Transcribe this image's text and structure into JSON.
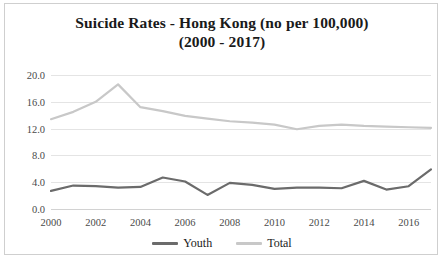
{
  "chart_data": {
    "type": "line",
    "title": "Suicide Rates - Hong Kong (no per 100,000) (2000 - 2017)",
    "title_line1": "Suicide Rates - Hong Kong (no per 100,000)",
    "title_line2": "(2000 - 2017)",
    "xlabel": "",
    "ylabel": "",
    "x": [
      2000,
      2001,
      2002,
      2003,
      2004,
      2005,
      2006,
      2007,
      2008,
      2009,
      2010,
      2011,
      2012,
      2013,
      2014,
      2015,
      2016,
      2017
    ],
    "xtick_labels": [
      "2000",
      "2002",
      "2004",
      "2006",
      "2008",
      "2010",
      "2012",
      "2014",
      "2016"
    ],
    "xtick_values": [
      2000,
      2002,
      2004,
      2006,
      2008,
      2010,
      2012,
      2014,
      2016
    ],
    "ytick_labels": [
      "0.0",
      "4.0",
      "8.0",
      "12.0",
      "16.0",
      "20.0"
    ],
    "ytick_values": [
      0,
      4,
      8,
      12,
      16,
      20
    ],
    "ylim": [
      0,
      20
    ],
    "xlim": [
      2000,
      2017
    ],
    "grid": true,
    "legend_position": "bottom-center",
    "series": [
      {
        "name": "Youth",
        "color": "#6b6b6b",
        "values": [
          2.7,
          3.5,
          3.4,
          3.2,
          3.3,
          4.7,
          4.1,
          2.1,
          3.9,
          3.6,
          3.0,
          3.2,
          3.2,
          3.1,
          4.2,
          2.9,
          3.4,
          5.9
        ]
      },
      {
        "name": "Total",
        "color": "#c8c8c8",
        "values": [
          13.4,
          14.5,
          16.0,
          18.6,
          15.2,
          14.6,
          13.9,
          13.5,
          13.1,
          12.9,
          12.6,
          11.9,
          12.4,
          12.6,
          12.4,
          12.3,
          12.2,
          12.1
        ]
      }
    ]
  },
  "legend": {
    "entries": [
      {
        "label": "Youth",
        "color": "#6b6b6b"
      },
      {
        "label": "Total",
        "color": "#c8c8c8"
      }
    ]
  },
  "caption": {
    "text": ""
  }
}
